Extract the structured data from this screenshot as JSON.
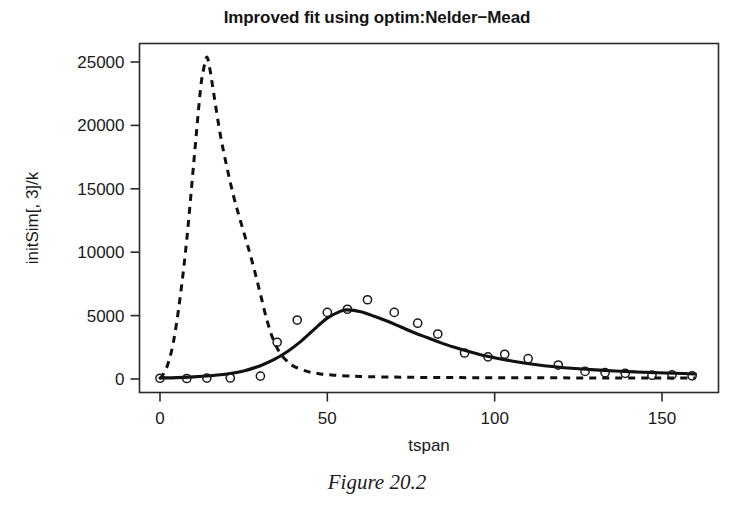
{
  "figure": {
    "caption": "Figure 20.2"
  },
  "chart_data": {
    "type": "line",
    "title": "Improved fit using optim:Nelder−Mead",
    "xlabel": "tspan",
    "ylabel": "initSim[, 3]/k",
    "xlim": [
      -3,
      163
    ],
    "ylim": [
      -900,
      26400
    ],
    "grid": false,
    "legend": "none",
    "xticks": [
      0,
      50,
      100,
      150
    ],
    "xtick_labels": [
      "0",
      "50",
      "100",
      "150"
    ],
    "yticks": [
      0,
      5000,
      10000,
      15000,
      20000,
      25000
    ],
    "ytick_labels": [
      "0",
      "5000",
      "10000",
      "15000",
      "20000",
      "25000"
    ],
    "series": [
      {
        "name": "initial simulation",
        "style": "dashed",
        "color": "#111111",
        "x": [
          0,
          2,
          4,
          6,
          8,
          10,
          12,
          13,
          14,
          15,
          16,
          18,
          20,
          22,
          24,
          26,
          28,
          30,
          32,
          34,
          36,
          38,
          40,
          44,
          48,
          52,
          56,
          60,
          70,
          80,
          90,
          100,
          110,
          120,
          130,
          140,
          150,
          160
        ],
        "y": [
          0,
          900,
          2900,
          6400,
          11000,
          16800,
          22600,
          24400,
          25400,
          24300,
          22600,
          19300,
          16700,
          14400,
          12500,
          10700,
          8800,
          6700,
          4600,
          3000,
          2000,
          1400,
          1000,
          600,
          400,
          300,
          240,
          200,
          150,
          120,
          110,
          100,
          95,
          90,
          85,
          80,
          75,
          70
        ]
      },
      {
        "name": "fitted model (Nelder-Mead)",
        "style": "solid",
        "color": "#111111",
        "x": [
          0,
          5,
          10,
          15,
          20,
          25,
          30,
          34,
          38,
          42,
          46,
          50,
          54,
          56,
          60,
          64,
          68,
          72,
          76,
          80,
          84,
          88,
          92,
          96,
          100,
          106,
          112,
          118,
          124,
          130,
          136,
          142,
          148,
          154,
          160
        ],
        "y": [
          80,
          110,
          170,
          260,
          400,
          640,
          1050,
          1520,
          2150,
          2950,
          3900,
          4800,
          5350,
          5450,
          5300,
          4950,
          4550,
          4100,
          3650,
          3250,
          2850,
          2500,
          2180,
          1900,
          1680,
          1380,
          1150,
          970,
          830,
          720,
          630,
          560,
          500,
          450,
          400
        ]
      }
    ],
    "observations": {
      "name": "observed data",
      "marker": "open-circle",
      "x": [
        0,
        8,
        14,
        21,
        30,
        35,
        41,
        50,
        56,
        62,
        70,
        77,
        83,
        91,
        98,
        103,
        110,
        119,
        127,
        133,
        139,
        147,
        153,
        159
      ],
      "y": [
        60,
        40,
        70,
        80,
        230,
        2900,
        4650,
        5250,
        5500,
        6250,
        5250,
        4400,
        3550,
        2050,
        1750,
        1950,
        1600,
        1100,
        600,
        500,
        450,
        300,
        330,
        250
      ]
    }
  }
}
